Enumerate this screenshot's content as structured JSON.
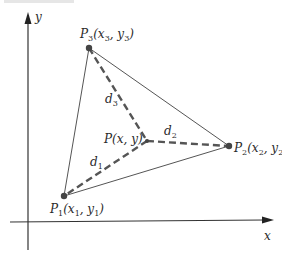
{
  "figure": {
    "caption_partial": "FIGURE",
    "axes": {
      "x_label": "x",
      "y_label": "y"
    },
    "points": {
      "P1": {
        "name": "P",
        "sub": "1",
        "coords_text": "(x",
        "coords_sub1": "1",
        "mid": ", y",
        "coords_sub2": "1",
        "close": ")"
      },
      "P2": {
        "name": "P",
        "sub": "2",
        "coords_text": "(x",
        "coords_sub1": "2",
        "mid": ", y",
        "coords_sub2": "2",
        "close": ")"
      },
      "P3": {
        "name": "P",
        "sub": "3",
        "coords_text": "(x",
        "coords_sub1": "3",
        "mid": ", y",
        "coords_sub2": "3",
        "close": ")"
      },
      "P": {
        "label": "P(x, y)"
      }
    },
    "distances": {
      "d1": {
        "name": "d",
        "sub": "1"
      },
      "d2": {
        "name": "d",
        "sub": "2"
      },
      "d3": {
        "name": "d",
        "sub": "3"
      }
    },
    "colors": {
      "line": "#555555",
      "axis": "#333333",
      "text": "#2a2a2a",
      "background": "#ffffff"
    }
  }
}
